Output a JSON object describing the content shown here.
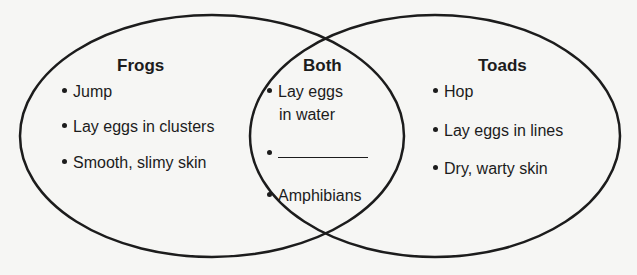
{
  "diagram": {
    "type": "venn",
    "sets": [
      {
        "id": "frogs",
        "title": "Frogs",
        "items": [
          "Jump",
          "Lay eggs in clusters",
          "Smooth, slimy skin"
        ]
      },
      {
        "id": "both",
        "title": "Both",
        "items": [
          "Lay eggs",
          "in water",
          "",
          "Amphibians"
        ]
      },
      {
        "id": "toads",
        "title": "Toads",
        "items": [
          "Hop",
          "Lay eggs in lines",
          "Dry, warty skin"
        ]
      }
    ],
    "colors": {
      "stroke": "#1c1c1c",
      "background": "#f6f6f4"
    }
  }
}
